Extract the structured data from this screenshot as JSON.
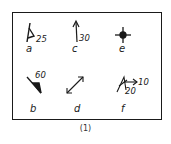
{
  "figure": {
    "caption": "(1)",
    "symbols": [
      {
        "id": "a",
        "label": "a",
        "value": "25",
        "meaning": "strike-and-dip (inclined bedding)"
      },
      {
        "id": "b",
        "label": "b",
        "value": "60",
        "meaning": "strike-and-dip (filled triangle)"
      },
      {
        "id": "c",
        "label": "c",
        "value": "30",
        "meaning": "plunge arrow"
      },
      {
        "id": "d",
        "label": "d",
        "value": "",
        "meaning": "double-headed arrow"
      },
      {
        "id": "e",
        "label": "e",
        "value": "",
        "meaning": "horizontal bedding / cross with dot"
      },
      {
        "id": "f",
        "label": "f",
        "value": "10",
        "value2": "20",
        "meaning": "dip with lineation arrow"
      }
    ]
  },
  "colors": {
    "ink": "#1a1a1a",
    "background": "#ffffff"
  }
}
